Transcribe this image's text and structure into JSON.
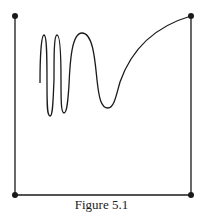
{
  "figure": {
    "caption": "Figure 5.1",
    "stroke_color": "#1a1a1a",
    "background": "#ffffff",
    "corner_points": [
      {
        "name": "top-left",
        "x": 15,
        "y": 16
      },
      {
        "name": "top-right",
        "x": 191,
        "y": 16
      },
      {
        "name": "bottom-left",
        "x": 15,
        "y": 195
      },
      {
        "name": "bottom-right",
        "x": 191,
        "y": 195
      }
    ],
    "curve_description": "Oscillating curve with increasing wavelength starting near the left side, then rising smoothly to the top-right corner"
  }
}
